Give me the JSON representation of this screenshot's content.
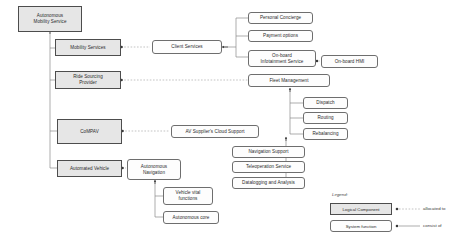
{
  "diagram": {
    "colors": {
      "logical_fill": "#e6e6e6",
      "logical_stroke": "#4d4d4d",
      "function_fill": "#fdfdfd",
      "function_stroke": "#6e6e6e",
      "line": "#8a8a8a"
    },
    "nodes": {
      "autonomous_mobility_service": "Autonomous\nMobility Service",
      "mobility_services": "Mobility Services",
      "ride_sourcing_provider": "Ride Sourcing\nProvider",
      "compav": "CoMPAV",
      "automated_vehicle": "Automated Vehicle",
      "client_services": "Client Services",
      "personal_concierge": "Personal Concierge",
      "payment_options": "Payment options",
      "onboard_infotainment_service": "On-board\nInfotainment Service",
      "onboard_hmi": "On-board HMI",
      "fleet_management": "Fleet Management",
      "dispatch": "Dispatch",
      "routing": "Routing",
      "rebalancing": "Rebalancing",
      "av_supplier_cloud_support": "AV Supplier's Cloud Support",
      "navigation_support": "Navigation Support",
      "teleoperation_service": "Teleoperation Service",
      "datalogging_and_analysis": "Datalogging and Analysis",
      "autonomous_navigation": "Autonomous\nNavigation",
      "vehicle_vital_functions": "Vehicle vital\nfunctions",
      "autonomous_core": "Autonomous core"
    },
    "legend": {
      "title": "Legend:",
      "logical_component": "Logical Component",
      "system_function": "System function",
      "allocated_to": "allocated to",
      "consist_of": "consist of"
    }
  }
}
